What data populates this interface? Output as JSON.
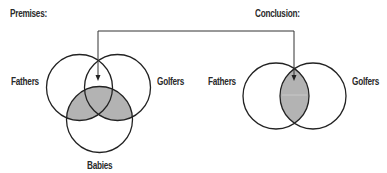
{
  "headings": {
    "premises": "Premises:",
    "conclusion": "Conclusion:"
  },
  "premises_diagram": {
    "labels": {
      "left": "Fathers",
      "right": "Golfers",
      "bottom": "Babies"
    },
    "shaded_regions": [
      "Fathers ∩ Babies",
      "Golfers ∩ Babies"
    ]
  },
  "conclusion_diagram": {
    "labels": {
      "left": "Fathers",
      "right": "Golfers"
    },
    "shaded_regions": [
      "Fathers ∩ Golfers"
    ]
  },
  "connector": {
    "description": "Arrow from the Fathers∩Golfers region of the premises diagram to the Fathers∩Golfers region of the conclusion diagram"
  },
  "colors": {
    "stroke": "#222222",
    "shade": "#b3b3b3",
    "background": "#ffffff"
  }
}
